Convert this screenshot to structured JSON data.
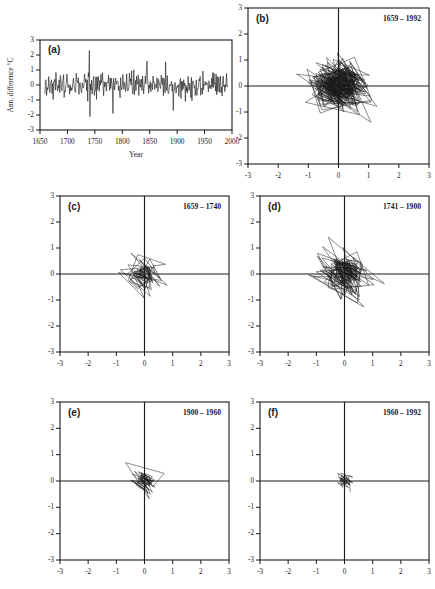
{
  "figure": {
    "background": "#ffffff",
    "ink_color": "#1a1a1a"
  },
  "chart_data": [
    {
      "type": "line",
      "panel": "a",
      "panel_label": "(a)",
      "title": "",
      "xlabel": "Year",
      "ylabel": "Ann. difference °C",
      "xlim": [
        1650,
        2000
      ],
      "ylim": [
        -3,
        3
      ],
      "xticks": [
        1650,
        1700,
        1750,
        1800,
        1850,
        1900,
        1950,
        2000
      ],
      "xtick_labels": [
        "1650",
        "1700",
        "1750",
        "1800",
        "1850",
        "1900",
        "1950",
        "2000"
      ],
      "yticks": [
        -3,
        -2,
        -1,
        0,
        1,
        2,
        3
      ],
      "ytick_labels": [
        "-3",
        "-2",
        "-1",
        "0",
        "1",
        "2",
        "3"
      ],
      "grid": false,
      "series_name": "Annual temperature difference",
      "data_start_year": 1659,
      "data_end_year": 1992,
      "n_points": 334,
      "seed": 20731,
      "noise_sigma": 0.52,
      "notable_spikes": [
        {
          "year": 1740,
          "value": 2.3
        },
        {
          "year": 1741,
          "value": -2.1
        },
        {
          "year": 1783,
          "value": -1.9
        },
        {
          "year": 1845,
          "value": 1.6
        },
        {
          "year": 1879,
          "value": 1.55
        },
        {
          "year": 1893,
          "value": -1.7
        }
      ]
    },
    {
      "type": "line",
      "panel": "b",
      "panel_label": "(b)",
      "epoch_label": "1659 – 1992",
      "year_start": 1659,
      "year_end": 1992,
      "n_points": 334,
      "seed": 4412,
      "noise_sigma": 0.56,
      "spread": 1.0,
      "xlim": [
        -3,
        3
      ],
      "ylim": [
        -3,
        3
      ],
      "xticks": [
        -3,
        -2,
        -1,
        0,
        1,
        2,
        3
      ],
      "xtick_labels": [
        "-3",
        "-2",
        "-1",
        "0",
        "1",
        "2",
        "3"
      ],
      "yticks": [
        -3,
        -2,
        -1,
        0,
        1,
        2,
        3
      ],
      "ytick_labels": [
        "-3",
        "-2",
        "-1",
        "0",
        "1",
        "2",
        "3"
      ],
      "grid": true,
      "xlabel": "",
      "ylabel": ""
    },
    {
      "type": "line",
      "panel": "c",
      "panel_label": "(c)",
      "epoch_label": "1659 – 1740",
      "year_start": 1659,
      "year_end": 1740,
      "n_points": 82,
      "seed": 9183,
      "noise_sigma": 0.5,
      "spread": 0.92,
      "xlim": [
        -3,
        3
      ],
      "ylim": [
        -3,
        3
      ],
      "xticks": [
        -3,
        -2,
        -1,
        0,
        1,
        2,
        3
      ],
      "xtick_labels": [
        "-3",
        "-2",
        "-1",
        "0",
        "1",
        "2",
        "3"
      ],
      "yticks": [
        -3,
        -2,
        -1,
        0,
        1,
        2,
        3
      ],
      "ytick_labels": [
        "-3",
        "-2",
        "-1",
        "0",
        "1",
        "2",
        "3"
      ],
      "grid": true,
      "xlabel": "",
      "ylabel": ""
    },
    {
      "type": "line",
      "panel": "d",
      "panel_label": "(d)",
      "epoch_label": "1741 – 1900",
      "year_start": 1741,
      "year_end": 1900,
      "n_points": 160,
      "seed": 5570,
      "noise_sigma": 0.55,
      "spread": 0.98,
      "xlim": [
        -3,
        3
      ],
      "ylim": [
        -3,
        3
      ],
      "xticks": [
        -3,
        -2,
        -1,
        0,
        1,
        2,
        3
      ],
      "xtick_labels": [
        "-3",
        "-2",
        "-1",
        "0",
        "1",
        "2",
        "3"
      ],
      "yticks": [
        -3,
        -2,
        -1,
        0,
        1,
        2,
        3
      ],
      "ytick_labels": [
        "-3",
        "-2",
        "-1",
        "0",
        "1",
        "2",
        "3"
      ],
      "grid": true,
      "xlabel": "",
      "ylabel": ""
    },
    {
      "type": "line",
      "panel": "e",
      "panel_label": "(e)",
      "epoch_label": "1900 – 1960",
      "year_start": 1900,
      "year_end": 1960,
      "n_points": 61,
      "seed": 3304,
      "noise_sigma": 0.42,
      "spread": 0.66,
      "xlim": [
        -3,
        3
      ],
      "ylim": [
        -3,
        3
      ],
      "xticks": [
        -3,
        -2,
        -1,
        0,
        1,
        2,
        3
      ],
      "xtick_labels": [
        "-3",
        "-2",
        "-1",
        "0",
        "1",
        "2",
        "3"
      ],
      "yticks": [
        -3,
        -2,
        -1,
        0,
        1,
        2,
        3
      ],
      "ytick_labels": [
        "-3",
        "-2",
        "-1",
        "0",
        "1",
        "2",
        "3"
      ],
      "grid": true,
      "xlabel": "",
      "ylabel": ""
    },
    {
      "type": "line",
      "panel": "f",
      "panel_label": "(f)",
      "epoch_label": "1960 – 1992",
      "year_start": 1960,
      "year_end": 1992,
      "n_points": 33,
      "seed": 7725,
      "noise_sigma": 0.36,
      "spread": 0.56,
      "xlim": [
        -3,
        3
      ],
      "ylim": [
        -3,
        3
      ],
      "xticks": [
        -3,
        -2,
        -1,
        0,
        1,
        2,
        3
      ],
      "xtick_labels": [
        "-3",
        "-2",
        "-1",
        "0",
        "1",
        "2",
        "3"
      ],
      "yticks": [
        -3,
        -2,
        -1,
        0,
        1,
        2,
        3
      ],
      "ytick_labels": [
        "-3",
        "-2",
        "-1",
        "0",
        "1",
        "2",
        "3"
      ],
      "grid": true,
      "xlabel": "",
      "ylabel": ""
    }
  ]
}
